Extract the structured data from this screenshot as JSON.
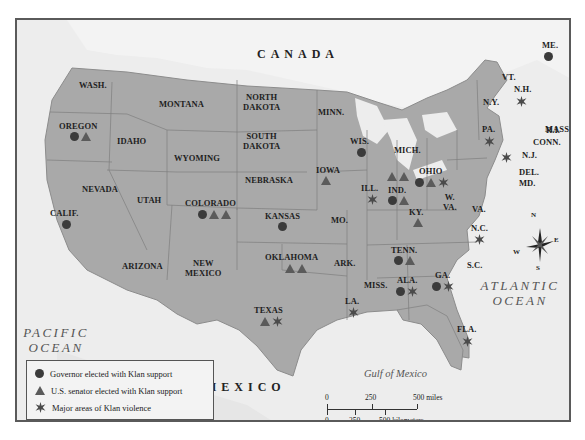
{
  "map": {
    "title_regions": {
      "canada": "CANADA",
      "mexico": "MEXICO"
    },
    "oceans": {
      "pacific": [
        "PACIFIC",
        "OCEAN"
      ],
      "atlantic": [
        "ATLANTIC",
        "OCEAN"
      ],
      "gulf": "Gulf of Mexico"
    },
    "states": {
      "wash": "WASH.",
      "oregon": "OREGON",
      "calif": "CALIF.",
      "idaho": "IDAHO",
      "nevada": "NEVADA",
      "montana": "MONTANA",
      "wyoming": "WYOMING",
      "utah": "UTAH",
      "arizona": "ARIZONA",
      "colorado": "COLORADO",
      "new_mexico": [
        "NEW",
        "MEXICO"
      ],
      "north_dakota": [
        "NORTH",
        "DAKOTA"
      ],
      "south_dakota": [
        "SOUTH",
        "DAKOTA"
      ],
      "nebraska": "NEBRASKA",
      "kansas": "KANSAS",
      "oklahoma": "OKLAHOMA",
      "texas": "TEXAS",
      "minn": "MINN.",
      "iowa": "IOWA",
      "mo": "MO.",
      "ark": "ARK.",
      "la": "LA.",
      "wis": "WIS.",
      "ill": "ILL.",
      "mich": "MICH.",
      "ind": "IND.",
      "ohio": "OHIO",
      "ky": "KY.",
      "tenn": "TENN.",
      "miss": "MISS.",
      "ala": "ALA.",
      "ga": "GA.",
      "fla": "FLA.",
      "sc": "S.C.",
      "nc": "N.C.",
      "va": "VA.",
      "wva": [
        "W.",
        "VA."
      ],
      "pa": "PA.",
      "ny": "N.Y.",
      "vt": "VT.",
      "nh": "N.H.",
      "me": "ME.",
      "mass": "MASS.",
      "ri": "R.I.",
      "conn": "CONN.",
      "nj": "N.J.",
      "del": "DEL.",
      "md": "MD."
    },
    "markers": {
      "oregon": [
        "governor",
        "senator"
      ],
      "calif": [
        "governor"
      ],
      "colorado": [
        "governor",
        "senator",
        "senator"
      ],
      "kansas": [
        "governor"
      ],
      "oklahoma": [
        "senator",
        "senator"
      ],
      "texas": [
        "senator",
        "violence"
      ],
      "iowa": [
        "senator"
      ],
      "wis": [
        "governor"
      ],
      "ill": [
        "violence"
      ],
      "ind": [
        "senator",
        "senator",
        "governor",
        "senator"
      ],
      "ohio": [
        "governor",
        "senator",
        "violence"
      ],
      "ky": [
        "senator"
      ],
      "tenn": [
        "governor",
        "senator"
      ],
      "la": [
        "violence"
      ],
      "ala": [
        "governor",
        "violence"
      ],
      "ga": [
        "governor",
        "violence"
      ],
      "fla": [
        "violence"
      ],
      "nc": [
        "violence"
      ],
      "pa": [
        "violence"
      ],
      "nj": [
        "violence"
      ],
      "nh": [
        "violence"
      ],
      "me": [
        "governor"
      ]
    },
    "colors": {
      "land": "#a9a9a9",
      "background": "#ededed",
      "marker": "#3b3b3b",
      "border": "#5a5a5a"
    }
  },
  "legend": {
    "items": [
      {
        "symbol": "circle",
        "label": "Governor elected with Klan support"
      },
      {
        "symbol": "triangle",
        "label": "U.S. senator elected with Klan support"
      },
      {
        "symbol": "star",
        "label": "Major areas of Klan violence"
      }
    ]
  },
  "scale": {
    "miles": {
      "labels": [
        "0",
        "250",
        "500 miles"
      ]
    },
    "km": {
      "labels": [
        "0",
        "250",
        "500 kilometers"
      ]
    }
  },
  "compass": {
    "n": "N",
    "s": "S",
    "e": "E",
    "w": "W"
  }
}
